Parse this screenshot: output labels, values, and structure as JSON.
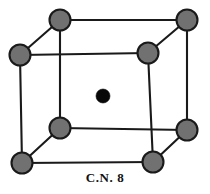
{
  "figure": {
    "title": "",
    "caption": "C.N. 8",
    "width": 210,
    "height": 194,
    "background_color": "#ffffff"
  },
  "colors": {
    "corner_atom_fill": "#717171",
    "corner_atom_stroke": "#1a1a1a",
    "center_atom_fill": "#080808",
    "edge_stroke": "#1a1a1a",
    "caption_color": "#111111"
  },
  "geometry": {
    "corner_radius": 10.5,
    "center_radius": 7.0,
    "edge_width": 2.1,
    "back_face": {
      "top_left": [
        60,
        20
      ],
      "top_right": [
        187,
        20
      ],
      "bottom_right": [
        187,
        130
      ],
      "bottom_left": [
        60,
        128
      ]
    },
    "front_face": {
      "top_left": [
        20,
        55
      ],
      "top_right": [
        148,
        53
      ],
      "bottom_right": [
        153,
        162
      ],
      "bottom_left": [
        22,
        163
      ]
    },
    "body_center": [
      103,
      96
    ]
  },
  "atoms": [
    {
      "id": "corner-back-top-left",
      "label": "corner atom",
      "cx": 60,
      "cy": 20,
      "r": 10.5,
      "kind": "corner"
    },
    {
      "id": "corner-back-top-right",
      "label": "corner atom",
      "cx": 187,
      "cy": 20,
      "r": 10.5,
      "kind": "corner"
    },
    {
      "id": "corner-front-top-left",
      "label": "corner atom",
      "cx": 20,
      "cy": 55,
      "r": 10.5,
      "kind": "corner"
    },
    {
      "id": "corner-front-top-right",
      "label": "corner atom",
      "cx": 148,
      "cy": 53,
      "r": 10.5,
      "kind": "corner"
    },
    {
      "id": "corner-back-bottom-left",
      "label": "corner atom",
      "cx": 60,
      "cy": 128,
      "r": 10.5,
      "kind": "corner"
    },
    {
      "id": "corner-back-bottom-right",
      "label": "corner atom",
      "cx": 187,
      "cy": 130,
      "r": 10.5,
      "kind": "corner"
    },
    {
      "id": "corner-front-bottom-left",
      "label": "corner atom",
      "cx": 22,
      "cy": 163,
      "r": 10.5,
      "kind": "corner"
    },
    {
      "id": "corner-front-bottom-right",
      "label": "corner atom",
      "cx": 153,
      "cy": 162,
      "r": 10.5,
      "kind": "corner"
    },
    {
      "id": "body-center-atom",
      "label": "body-centre atom",
      "cx": 103,
      "cy": 96,
      "r": 7.0,
      "kind": "center"
    }
  ],
  "edges": [
    {
      "id": "edge-back-top",
      "x1": 60,
      "y1": 20,
      "x2": 187,
      "y2": 20
    },
    {
      "id": "edge-back-left",
      "x1": 60,
      "y1": 20,
      "x2": 60,
      "y2": 128
    },
    {
      "id": "edge-back-right",
      "x1": 187,
      "y1": 20,
      "x2": 187,
      "y2": 130
    },
    {
      "id": "edge-back-bottom",
      "x1": 60,
      "y1": 128,
      "x2": 187,
      "y2": 130
    },
    {
      "id": "edge-front-top",
      "x1": 20,
      "y1": 55,
      "x2": 148,
      "y2": 53
    },
    {
      "id": "edge-front-left",
      "x1": 20,
      "y1": 55,
      "x2": 22,
      "y2": 163
    },
    {
      "id": "edge-front-right",
      "x1": 148,
      "y1": 53,
      "x2": 153,
      "y2": 162
    },
    {
      "id": "edge-front-bottom",
      "x1": 22,
      "y1": 163,
      "x2": 153,
      "y2": 162
    },
    {
      "id": "edge-diag-top-left",
      "x1": 20,
      "y1": 55,
      "x2": 60,
      "y2": 20
    },
    {
      "id": "edge-diag-top-right",
      "x1": 148,
      "y1": 53,
      "x2": 187,
      "y2": 20
    },
    {
      "id": "edge-diag-bottom-left",
      "x1": 22,
      "y1": 163,
      "x2": 60,
      "y2": 128
    },
    {
      "id": "edge-diag-bottom-right",
      "x1": 153,
      "y1": 162,
      "x2": 187,
      "y2": 130
    }
  ]
}
